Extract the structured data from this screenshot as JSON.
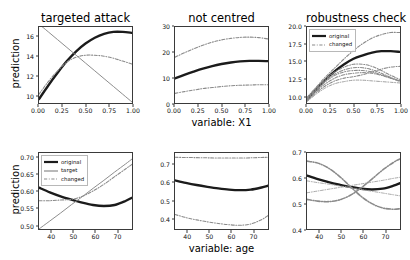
{
  "figure": {
    "width": 410,
    "height": 260,
    "background": "#ffffff"
  },
  "styles": {
    "original_color": "#1b1b1b",
    "target_color": "#8a8a8a",
    "changed_color": "#8a8a8a",
    "axis_color": "#3a3a3a",
    "text_color": "#111111"
  },
  "legends": {
    "robustness": {
      "items": [
        {
          "label": "original",
          "style": "solid",
          "color": "#1b1b1b"
        },
        {
          "label": "changed",
          "style": "dashdot",
          "color": "#8a8a8a"
        }
      ]
    },
    "targeted_age": {
      "items": [
        {
          "label": "original",
          "style": "solid",
          "color": "#1b1b1b"
        },
        {
          "label": "target",
          "style": "solid",
          "color": "#8a8a8a"
        },
        {
          "label": "changed",
          "style": "dashdot",
          "color": "#8a8a8a"
        }
      ]
    }
  },
  "axis_labels": {
    "ylabel_top": "prediction",
    "ylabel_bottom": "prediction",
    "xlabel_top": "variable: X1",
    "xlabel_bottom": "variable: age"
  },
  "chart_data": [
    {
      "id": "targeted-attack-x1",
      "type": "line",
      "title": "targeted attack",
      "xlabel": "",
      "ylabel": "prediction",
      "xlim": [
        0.0,
        1.0
      ],
      "ylim": [
        9.2,
        17.0
      ],
      "xticks": [
        "0.00",
        "0.25",
        "0.50",
        "0.75",
        "1.00"
      ],
      "xtickvals": [
        0.0,
        0.25,
        0.5,
        0.75,
        1.0
      ],
      "yticks": [
        "10",
        "12",
        "14",
        "16"
      ],
      "ytickvals": [
        10,
        12,
        14,
        16
      ],
      "grid": false,
      "legend": "none",
      "x": [
        0.0,
        0.1,
        0.2,
        0.3,
        0.4,
        0.5,
        0.6,
        0.7,
        0.8,
        0.9,
        1.0
      ],
      "series": [
        {
          "name": "original",
          "style": "solid",
          "color": "#1b1b1b",
          "width": 2.4,
          "values": [
            9.6,
            11.0,
            12.3,
            13.5,
            14.5,
            15.3,
            15.9,
            16.3,
            16.5,
            16.5,
            16.4
          ]
        },
        {
          "name": "changed",
          "style": "dashdot",
          "color": "#8a8a8a",
          "width": 1.1,
          "values": [
            10.1,
            11.4,
            12.5,
            13.4,
            13.9,
            14.1,
            14.1,
            14.0,
            13.8,
            13.5,
            13.2
          ]
        },
        {
          "name": "target",
          "style": "solid",
          "color": "#8a8a8a",
          "width": 1.0,
          "values": [
            17.3,
            16.5,
            15.7,
            14.9,
            14.1,
            13.3,
            12.5,
            11.7,
            10.9,
            10.1,
            9.3
          ]
        }
      ]
    },
    {
      "id": "not-centred-x1",
      "type": "line",
      "title": "not centred",
      "xlabel": "variable: X1",
      "ylabel": "",
      "xlim": [
        0.0,
        1.0
      ],
      "ylim": [
        0,
        30
      ],
      "xticks": [
        "0.00",
        "0.25",
        "0.50",
        "0.75",
        "1.00"
      ],
      "xtickvals": [
        0.0,
        0.25,
        0.5,
        0.75,
        1.0
      ],
      "yticks": [
        "0",
        "10",
        "20",
        "30"
      ],
      "ytickvals": [
        0,
        10,
        20,
        30
      ],
      "grid": false,
      "legend": "none",
      "x": [
        0.0,
        0.1,
        0.2,
        0.3,
        0.4,
        0.5,
        0.6,
        0.7,
        0.8,
        0.9,
        1.0
      ],
      "series": [
        {
          "name": "original",
          "style": "solid",
          "color": "#1b1b1b",
          "width": 2.4,
          "values": [
            9.7,
            11.1,
            12.4,
            13.6,
            14.6,
            15.4,
            16.0,
            16.4,
            16.6,
            16.6,
            16.5
          ]
        },
        {
          "name": "changed-upper",
          "style": "dashdot",
          "color": "#8a8a8a",
          "width": 1.1,
          "values": [
            18.1,
            19.8,
            21.4,
            22.8,
            24.0,
            24.9,
            25.5,
            25.9,
            26.0,
            25.8,
            25.3
          ]
        },
        {
          "name": "changed-lower",
          "style": "dashdot",
          "color": "#8a8a8a",
          "width": 1.1,
          "values": [
            3.8,
            4.5,
            5.1,
            5.7,
            6.1,
            6.5,
            6.8,
            7.0,
            7.1,
            7.2,
            7.2
          ]
        }
      ]
    },
    {
      "id": "robustness-check-x1",
      "type": "line",
      "title": "robustness check",
      "xlabel": "",
      "ylabel": "",
      "xlim": [
        0.0,
        1.0
      ],
      "ylim": [
        9.0,
        20.0
      ],
      "xticks": [
        "0.00",
        "0.25",
        "0.50",
        "0.75",
        "1.00"
      ],
      "xtickvals": [
        0.0,
        0.25,
        0.5,
        0.75,
        1.0
      ],
      "yticks": [
        "10.0",
        "12.5",
        "15.0",
        "17.5",
        "20.0"
      ],
      "ytickvals": [
        10.0,
        12.5,
        15.0,
        17.5,
        20.0
      ],
      "grid": false,
      "legend": "upper-left",
      "x": [
        0.0,
        0.1,
        0.2,
        0.3,
        0.4,
        0.5,
        0.6,
        0.7,
        0.8,
        0.9,
        1.0
      ],
      "series": [
        {
          "name": "original",
          "style": "solid",
          "color": "#1b1b1b",
          "width": 2.4,
          "values": [
            9.5,
            11.0,
            12.4,
            13.6,
            14.6,
            15.4,
            15.9,
            16.3,
            16.5,
            16.5,
            16.4
          ]
        },
        {
          "name": "changed-1",
          "style": "dashdot",
          "color": "#8a8a8a",
          "width": 1.1,
          "values": [
            9.8,
            11.3,
            12.8,
            14.1,
            15.4,
            16.6,
            17.6,
            18.4,
            18.9,
            19.2,
            19.2
          ]
        },
        {
          "name": "changed-2",
          "style": "dashdot",
          "color": "#8a8a8a",
          "width": 1.1,
          "values": [
            9.7,
            11.2,
            12.5,
            13.5,
            14.2,
            14.6,
            14.6,
            14.3,
            13.7,
            13.0,
            12.4
          ]
        },
        {
          "name": "changed-3",
          "style": "dashdot",
          "color": "#8a8a8a",
          "width": 1.1,
          "values": [
            9.6,
            11.0,
            12.3,
            13.2,
            13.8,
            14.1,
            14.1,
            13.8,
            13.3,
            12.7,
            12.2
          ]
        },
        {
          "name": "changed-4",
          "style": "dashdot",
          "color": "#8a8a8a",
          "width": 1.1,
          "values": [
            9.5,
            10.9,
            12.1,
            13.0,
            13.5,
            13.7,
            13.7,
            13.5,
            13.1,
            12.6,
            12.1
          ]
        },
        {
          "name": "changed-5",
          "style": "dashdot",
          "color": "#8a8a8a",
          "width": 1.1,
          "values": [
            9.4,
            10.7,
            11.8,
            12.6,
            13.1,
            13.3,
            13.4,
            13.3,
            13.0,
            12.6,
            12.2
          ]
        },
        {
          "name": "changed-6",
          "style": "dashdot",
          "color": "#8a8a8a",
          "width": 1.1,
          "values": [
            9.3,
            10.5,
            11.5,
            12.2,
            12.6,
            12.8,
            13.1,
            13.5,
            13.9,
            14.2,
            14.3
          ]
        },
        {
          "name": "changed-7",
          "style": "dashdot",
          "color": "#9d9d9d",
          "width": 1.0,
          "values": [
            9.2,
            10.3,
            11.2,
            11.8,
            12.1,
            12.3,
            12.3,
            12.2,
            12.1,
            12.0,
            11.9
          ]
        }
      ]
    },
    {
      "id": "targeted-attack-age",
      "type": "line",
      "title": "",
      "xlabel": "",
      "ylabel": "prediction",
      "xlim": [
        34,
        77
      ],
      "ylim": [
        0.487,
        0.715
      ],
      "xticks": [
        "40",
        "50",
        "60",
        "70"
      ],
      "xtickvals": [
        40,
        50,
        60,
        70
      ],
      "yticks": [
        "0.50",
        "0.55",
        "0.60",
        "0.65",
        "0.70"
      ],
      "ytickvals": [
        0.5,
        0.55,
        0.6,
        0.65,
        0.7
      ],
      "grid": false,
      "legend": "upper-left",
      "x": [
        34,
        39,
        44,
        49,
        54,
        59,
        64,
        69,
        74,
        77
      ],
      "series": [
        {
          "name": "original",
          "style": "solid",
          "color": "#1b1b1b",
          "width": 2.4,
          "values": [
            0.611,
            0.597,
            0.585,
            0.575,
            0.566,
            0.559,
            0.556,
            0.559,
            0.571,
            0.581
          ]
        },
        {
          "name": "changed",
          "style": "dashdot",
          "color": "#8a8a8a",
          "width": 1.1,
          "values": [
            0.572,
            0.572,
            0.574,
            0.576,
            0.585,
            0.601,
            0.621,
            0.644,
            0.667,
            0.681
          ]
        },
        {
          "name": "target",
          "style": "solid",
          "color": "#8a8a8a",
          "width": 1.0,
          "values": [
            0.487,
            0.511,
            0.535,
            0.56,
            0.584,
            0.609,
            0.633,
            0.658,
            0.682,
            0.697
          ]
        }
      ]
    },
    {
      "id": "not-centred-age",
      "type": "line",
      "title": "",
      "xlabel": "variable: age",
      "ylabel": "",
      "xlim": [
        34,
        77
      ],
      "ylim": [
        0.34,
        0.765
      ],
      "xticks": [
        "40",
        "50",
        "60",
        "70"
      ],
      "xtickvals": [
        40,
        50,
        60,
        70
      ],
      "yticks": [
        "0.4",
        "0.5",
        "0.6",
        "0.7"
      ],
      "ytickvals": [
        0.4,
        0.5,
        0.6,
        0.7
      ],
      "grid": false,
      "legend": "none",
      "x": [
        34,
        39,
        44,
        49,
        54,
        59,
        64,
        69,
        74,
        77
      ],
      "series": [
        {
          "name": "original",
          "style": "solid",
          "color": "#1b1b1b",
          "width": 2.4,
          "values": [
            0.612,
            0.598,
            0.586,
            0.576,
            0.567,
            0.56,
            0.557,
            0.56,
            0.572,
            0.582
          ]
        },
        {
          "name": "changed-upper",
          "style": "dashdot",
          "color": "#8a8a8a",
          "width": 1.1,
          "values": [
            0.741,
            0.74,
            0.739,
            0.738,
            0.737,
            0.737,
            0.737,
            0.738,
            0.74,
            0.741
          ]
        },
        {
          "name": "changed-lower",
          "style": "dashdot",
          "color": "#8a8a8a",
          "width": 1.1,
          "values": [
            0.421,
            0.404,
            0.391,
            0.38,
            0.371,
            0.364,
            0.361,
            0.368,
            0.392,
            0.415
          ]
        }
      ]
    },
    {
      "id": "robustness-check-age",
      "type": "line",
      "title": "",
      "xlabel": "",
      "ylabel": "",
      "xlim": [
        34,
        77
      ],
      "ylim": [
        0.4,
        0.7
      ],
      "xticks": [
        "40",
        "50",
        "60",
        "70"
      ],
      "xtickvals": [
        40,
        50,
        60,
        70
      ],
      "yticks": [
        "0.4",
        "0.5",
        "0.6",
        "0.7"
      ],
      "ytickvals": [
        0.4,
        0.5,
        0.6,
        0.7
      ],
      "grid": false,
      "legend": "none",
      "x": [
        34,
        39,
        44,
        49,
        54,
        59,
        64,
        69,
        74,
        77
      ],
      "series": [
        {
          "name": "original",
          "style": "solid",
          "color": "#1b1b1b",
          "width": 2.4,
          "values": [
            0.611,
            0.597,
            0.585,
            0.575,
            0.566,
            0.559,
            0.556,
            0.559,
            0.571,
            0.581
          ]
        },
        {
          "name": "changed-descending",
          "style": "dashdot",
          "color": "#8a8a8a",
          "width": 1.6,
          "values": [
            0.668,
            0.66,
            0.64,
            0.608,
            0.568,
            0.529,
            0.5,
            0.483,
            0.478,
            0.48
          ]
        },
        {
          "name": "changed-ascending",
          "style": "dashdot",
          "color": "#8a8a8a",
          "width": 1.6,
          "values": [
            0.517,
            0.51,
            0.508,
            0.515,
            0.533,
            0.562,
            0.597,
            0.633,
            0.663,
            0.677
          ]
        },
        {
          "name": "changed-flat-up",
          "style": "dashdot",
          "color": "#9d9d9d",
          "width": 0.9,
          "values": [
            0.543,
            0.55,
            0.557,
            0.564,
            0.571,
            0.578,
            0.585,
            0.592,
            0.6,
            0.604
          ]
        },
        {
          "name": "changed-flat-down",
          "style": "dashdot",
          "color": "#9d9d9d",
          "width": 0.9,
          "values": [
            0.59,
            0.583,
            0.577,
            0.57,
            0.563,
            0.556,
            0.549,
            0.542,
            0.535,
            0.531
          ]
        }
      ]
    }
  ]
}
